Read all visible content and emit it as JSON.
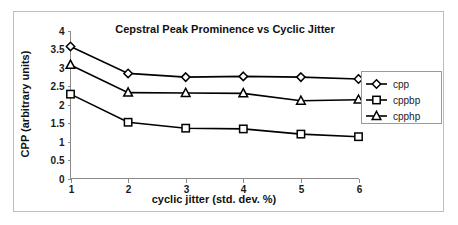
{
  "chart_data": {
    "type": "line",
    "title": "Cepstral Peak Prominence vs Cyclic Jitter",
    "xlabel": "cyclic jitter (std. dev. %)",
    "ylabel": "CPP (arbitrary units)",
    "x": [
      1,
      2,
      3,
      4,
      5,
      6
    ],
    "categories": [
      "1",
      "2",
      "3",
      "4",
      "5",
      "6"
    ],
    "xtick_labels": [
      "1",
      "2",
      "3",
      "4",
      "5",
      "6"
    ],
    "ytick_labels": [
      "0",
      "0.5",
      "1",
      "1.5",
      "2",
      "2.5",
      "3",
      "3.5",
      "4"
    ],
    "ytick_values": [
      0,
      0.5,
      1,
      1.5,
      2,
      2.5,
      3,
      3.5,
      4
    ],
    "xlim": [
      1,
      6
    ],
    "ylim": [
      0,
      4
    ],
    "grid": false,
    "legend_position": "right",
    "series": [
      {
        "name": "cpp",
        "marker": "diamond",
        "color": "#000000",
        "values": [
          3.57,
          2.84,
          2.74,
          2.76,
          2.74,
          2.69
        ]
      },
      {
        "name": "cppbp",
        "marker": "square",
        "color": "#000000",
        "values": [
          2.28,
          1.52,
          1.36,
          1.34,
          1.2,
          1.13
        ]
      },
      {
        "name": "cpphp",
        "marker": "triangle",
        "color": "#000000",
        "values": [
          3.07,
          2.32,
          2.31,
          2.3,
          2.1,
          2.13
        ]
      }
    ]
  },
  "legend": {
    "entries": [
      {
        "label": "cpp",
        "marker": "diamond-marker-icon"
      },
      {
        "label": "cppbp",
        "marker": "square-marker-icon"
      },
      {
        "label": "cpphp",
        "marker": "triangle-marker-icon"
      }
    ]
  },
  "colors": {
    "line": "#000000",
    "marker_fill": "#ffffff",
    "axis": "#8a8a8a",
    "frame": "#bdbdbd",
    "background": "#ffffff",
    "text": "#111111"
  }
}
